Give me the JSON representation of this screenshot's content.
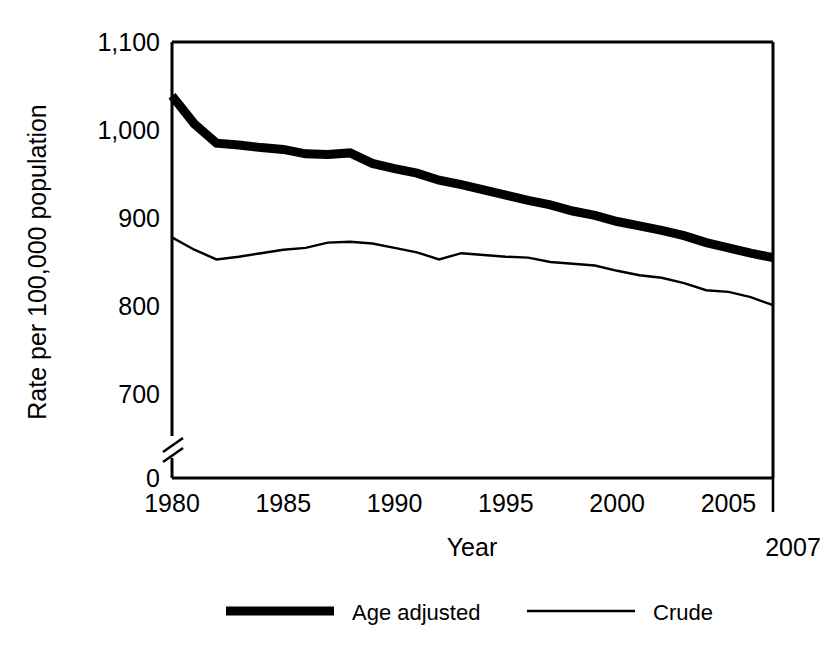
{
  "chart_data": {
    "type": "line",
    "title": "",
    "xlabel": "Year",
    "ylabel": "Rate per 100,000 population",
    "xlim": [
      1980,
      2007
    ],
    "ylim": [
      700,
      1100
    ],
    "axis_break": true,
    "axis_break_note": "y-axis broken between 0 and 700",
    "grid": false,
    "legend_position": "bottom",
    "x": [
      1980,
      1981,
      1982,
      1983,
      1984,
      1985,
      1986,
      1987,
      1988,
      1989,
      1990,
      1991,
      1992,
      1993,
      1994,
      1995,
      1996,
      1997,
      1998,
      1999,
      2000,
      2001,
      2002,
      2003,
      2004,
      2005,
      2006,
      2007
    ],
    "xtick_labels": [
      "1980",
      "1985",
      "1990",
      "1995",
      "2000",
      "2005"
    ],
    "xtick_values": [
      1980,
      1985,
      1990,
      1995,
      2000,
      2005
    ],
    "xtick_extra_label": "2007",
    "xtick_extra_value": 2007,
    "ytick_labels": [
      "1,100",
      "1,000",
      "900",
      "800",
      "700",
      "0"
    ],
    "ytick_values": [
      1100,
      1000,
      900,
      800,
      700,
      0
    ],
    "series": [
      {
        "name": "Age adjusted",
        "style": "thick",
        "values": [
          1039,
          1007,
          985,
          983,
          980,
          978,
          973,
          972,
          974,
          962,
          956,
          951,
          943,
          938,
          932,
          926,
          920,
          915,
          908,
          903,
          896,
          891,
          886,
          880,
          872,
          866,
          860,
          855
        ]
      },
      {
        "name": "Crude",
        "style": "thin",
        "values": [
          878,
          864,
          853,
          856,
          860,
          864,
          866,
          872,
          873,
          871,
          866,
          861,
          853,
          860,
          858,
          856,
          855,
          850,
          848,
          846,
          840,
          835,
          832,
          826,
          818,
          816,
          810,
          801
        ]
      }
    ]
  },
  "legend": {
    "items": [
      {
        "label": "Age adjusted",
        "style": "thick"
      },
      {
        "label": "Crude",
        "style": "thin"
      }
    ]
  }
}
